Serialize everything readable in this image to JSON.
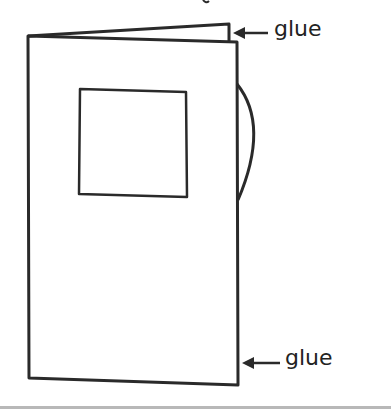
{
  "diagram": {
    "type": "folded-booklet-illustration",
    "labels": {
      "top_glue": "glue",
      "bottom_glue": "glue"
    },
    "colors": {
      "line": "#2a2a2a",
      "background": "#ffffff"
    }
  }
}
